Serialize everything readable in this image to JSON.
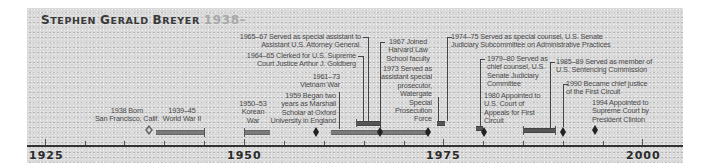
{
  "title": {
    "name_first": "S",
    "name_first_rest": "TEPHEN ",
    "name_mid": "G",
    "name_mid_rest": "ERALD ",
    "name_last": "B",
    "name_last_rest": "REYER",
    "years": "1938–"
  },
  "axis": {
    "start": 1925,
    "end": 2000,
    "labels": [
      "1925",
      "1950",
      "1975",
      "2000"
    ],
    "minor_tick_interval": 5
  },
  "events": {
    "birth": {
      "line1": "1938 Born",
      "line2": "San Francisco, Calif."
    },
    "ww2": {
      "line1": "1939–45",
      "line2": "World War II"
    },
    "korea": {
      "line1": "1950–53",
      "line2": "Korean",
      "line3": "War"
    },
    "marshall": {
      "line1": "1959 Began two",
      "line2": "years as Marshall",
      "line3": "Scholar at Oxford",
      "line4": "University in England"
    },
    "vietnam": {
      "line1": "1961–73",
      "line2": "Vietnam War"
    },
    "goldberg": {
      "line1": "1964–65 Clerked for U.S. Supreme",
      "line2": "Court Justice Arthur J. Goldberg"
    },
    "attorney": {
      "line1": "1965–67 Served as special assistant to",
      "line2": "Assistant U.S. Attorney General."
    },
    "harvard": {
      "line1": "1967 Joined",
      "line2": "Harvard Law",
      "line3": "School faculty"
    },
    "watergate": {
      "line1": "1973 Served as",
      "line2": "assistant special",
      "line3": "prosecutor,",
      "line4": "Watergate",
      "line5": "Special",
      "line6": "Prosecution",
      "line7": "Force"
    },
    "counsel": {
      "line1": "1974–75 Served as special counsel, U.S. Senate",
      "line2": "Judiciary Subcommittee on Administrative Practices"
    },
    "chief_counsel": {
      "line1": "1979–80 Served as",
      "line2": "chief counsel, U.S.",
      "line3": "Senate Judiciary",
      "line4": "Committee"
    },
    "first_circuit": {
      "line1": "1980 Appointed to",
      "line2": "U.S. Court of",
      "line3": "Appeals for First",
      "line4": "Circuit"
    },
    "sentencing": {
      "line1": "1985–89 Served as member of",
      "line2": "U.S. Sentencing Commission"
    },
    "chief_justice": {
      "line1": "1990 Became chief justice",
      "line2": "of the First Circuit"
    },
    "supreme": {
      "line1": "1994 Appointed to",
      "line2": "Supreme Court by",
      "line3": "President Clinton"
    }
  },
  "colors": {
    "background": "#d9d9d9",
    "text": "#4a4a4a",
    "title": "#3a3a3a",
    "title_years": "#a9a9a9",
    "bar": "#7a7a7a",
    "axis": "#333333"
  }
}
